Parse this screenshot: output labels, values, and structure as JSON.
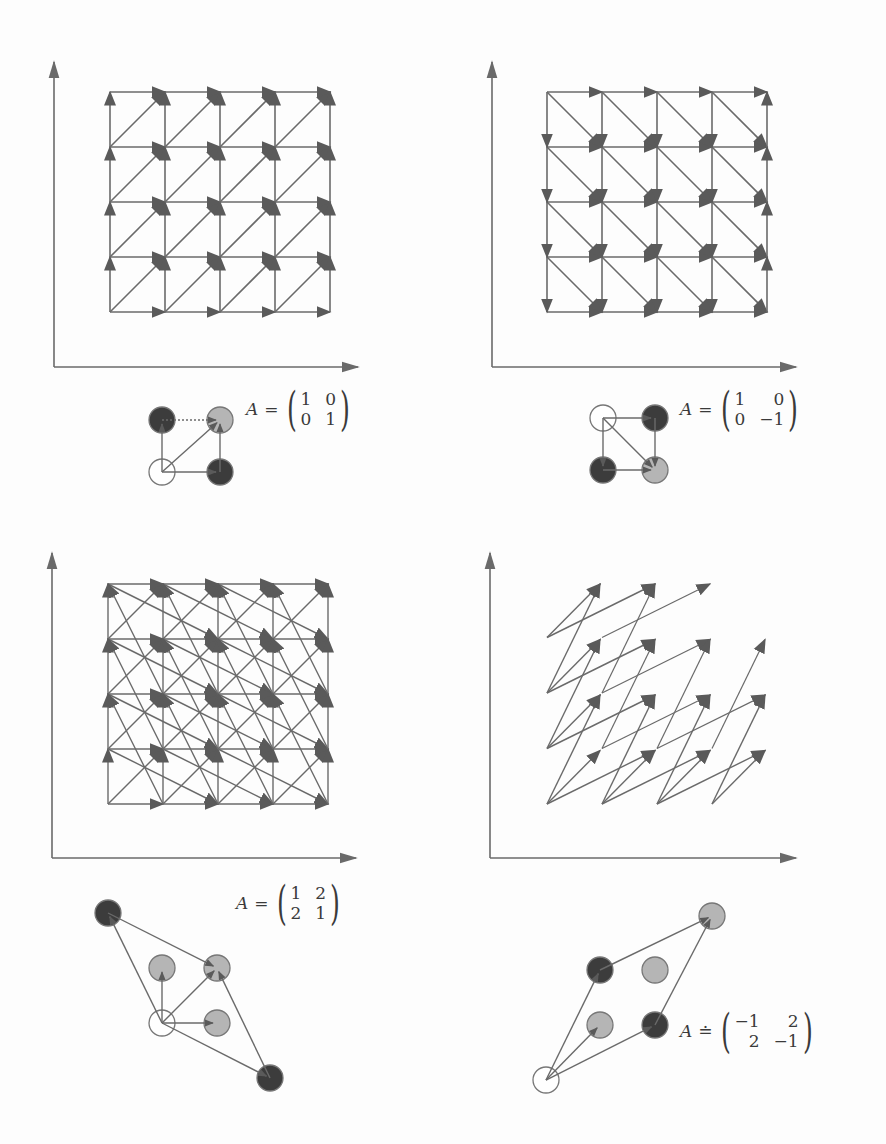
{
  "figure": {
    "stroke_color": "#6a6a6a",
    "head_color": "#5a5a5a",
    "black_node_color": "#3c3c3c",
    "gray_node_color": "#b5b5b5",
    "open_node_fill": "#ffffff",
    "panels": [
      {
        "id": "identity",
        "matrix_symbol": "A",
        "equals": "=",
        "matrix": [
          [
            "1",
            "0"
          ],
          [
            "0",
            "1"
          ]
        ],
        "vectors": [
          [
            1,
            0
          ],
          [
            0,
            1
          ],
          [
            1,
            1
          ]
        ],
        "grid": {
          "cols": 5,
          "rows": 5
        }
      },
      {
        "id": "reflection",
        "matrix_symbol": "A",
        "equals": "=",
        "matrix": [
          [
            "1",
            "0"
          ],
          [
            "0",
            "−1"
          ]
        ],
        "vectors": [
          [
            1,
            0
          ],
          [
            0,
            -1
          ],
          [
            1,
            -1
          ]
        ],
        "grid": {
          "cols": 5,
          "rows": 5
        }
      },
      {
        "id": "symmetric-positive",
        "matrix_symbol": "A",
        "equals": "=",
        "matrix": [
          [
            "1",
            "2"
          ],
          [
            "2",
            "1"
          ]
        ],
        "vectors": [
          [
            1,
            0
          ],
          [
            0,
            1
          ],
          [
            1,
            1
          ],
          [
            -1,
            2
          ],
          [
            2,
            -1
          ]
        ],
        "grid": {
          "cols": 5,
          "rows": 5
        }
      },
      {
        "id": "symmetric-negative",
        "matrix_symbol": "A",
        "equals": "≐",
        "matrix": [
          [
            "−1",
            "2"
          ],
          [
            "2",
            "−1"
          ]
        ],
        "vectors": [
          [
            1,
            1
          ],
          [
            2,
            1
          ],
          [
            1,
            2
          ]
        ],
        "grid": {
          "cols": 5,
          "rows": 5
        }
      }
    ]
  }
}
